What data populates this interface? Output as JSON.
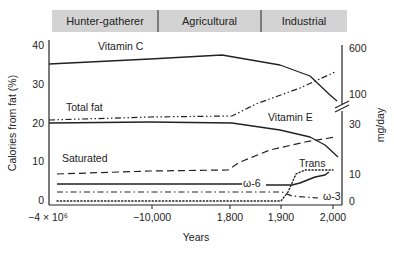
{
  "chart_data": {
    "type": "line",
    "title": "",
    "xlabel": "Years",
    "ylabel_left": "Calories from fat (%)",
    "ylabel_right": "mg/day",
    "grid": false,
    "eras": [
      {
        "label": "Hunter-gatherer",
        "x_start": 52,
        "x_end": 158
      },
      {
        "label": "Agricultural",
        "x_start": 158,
        "x_end": 261
      },
      {
        "label": "Industrial",
        "x_start": 261,
        "x_end": 347
      }
    ],
    "x_ticks": [
      {
        "label": "−4 × 10⁶",
        "px": 48
      },
      {
        "label": "−10,000",
        "px": 152
      },
      {
        "label": "1,800",
        "px": 230
      },
      {
        "label": "1,900",
        "px": 281
      },
      {
        "label": "2,000",
        "px": 333
      }
    ],
    "y_left_ticks": [
      {
        "label": "40",
        "value": 40
      },
      {
        "label": "30",
        "value": 30
      },
      {
        "label": "20",
        "value": 20
      },
      {
        "label": "10",
        "value": 10
      },
      {
        "label": "0",
        "value": 0
      }
    ],
    "y_left_range": [
      0,
      40
    ],
    "y_right_ticks": [
      {
        "label": "600",
        "py": 48
      },
      {
        "label": "100",
        "py": 94
      },
      {
        "label": "30",
        "py": 124
      },
      {
        "label": "10",
        "py": 174
      },
      {
        "label": "0",
        "py": 201
      }
    ],
    "series": [
      {
        "name": "Vitamin C",
        "axis": "right",
        "style": "solid",
        "width": 1.3,
        "label_pos": [
          98,
          50
        ],
        "points": [
          [
            49,
            64
          ],
          [
            150,
            59
          ],
          [
            222,
            55
          ],
          [
            280,
            65
          ],
          [
            310,
            76
          ],
          [
            330,
            95
          ],
          [
            337,
            101
          ]
        ]
      },
      {
        "name": "Total fat",
        "axis": "left",
        "style": "dashdotdot",
        "width": 1.2,
        "label_pos": [
          66,
          111
        ],
        "points": [
          [
            49,
            120
          ],
          [
            150,
            117
          ],
          [
            232,
            116
          ],
          [
            256,
            104
          ],
          [
            300,
            88
          ],
          [
            335,
            72
          ]
        ],
        "values_pct": [
          21,
          21.5,
          22,
          25,
          30,
          34
        ]
      },
      {
        "name": "Vitamin E",
        "axis": "right",
        "style": "solid",
        "width": 1.3,
        "label_pos": [
          268,
          121
        ],
        "points": [
          [
            49,
            123
          ],
          [
            150,
            122
          ],
          [
            232,
            123
          ],
          [
            280,
            130
          ],
          [
            310,
            137
          ],
          [
            325,
            145
          ],
          [
            338,
            157
          ]
        ]
      },
      {
        "name": "Saturated",
        "axis": "left",
        "style": "dashed",
        "width": 1.2,
        "label_pos": [
          62,
          162
        ],
        "points": [
          [
            57,
            174
          ],
          [
            150,
            171
          ],
          [
            228,
            170
          ],
          [
            240,
            162
          ],
          [
            270,
            150
          ],
          [
            305,
            142
          ],
          [
            335,
            137
          ]
        ],
        "values_pct": [
          7,
          7.5,
          8,
          10,
          13.5,
          15.5,
          17
        ]
      },
      {
        "name": "ω-6",
        "axis": "left",
        "style": "solid",
        "width": 1.5,
        "label_pos": [
          243,
          187
        ],
        "points": [
          [
            57,
            184
          ],
          [
            242,
            184
          ]
        ],
        "points2": [
          [
            266,
            185
          ],
          [
            292,
            185
          ],
          [
            300,
            183
          ],
          [
            315,
            177
          ],
          [
            325,
            175
          ],
          [
            329,
            172
          ]
        ],
        "values_pct": [
          4.5,
          4.5,
          4.5,
          5,
          6.5,
          7.5
        ]
      },
      {
        "name": "Trans",
        "axis": "left",
        "style": "dotted",
        "width": 1.4,
        "label_pos": [
          299,
          167
        ],
        "points": [
          [
            57,
            201
          ],
          [
            281,
            201
          ],
          [
            288,
            192
          ],
          [
            296,
            174
          ],
          [
            305,
            170
          ],
          [
            333,
            170
          ]
        ],
        "values_pct": [
          0.5,
          0.5,
          3,
          8,
          9,
          9
        ]
      },
      {
        "name": "ω-3",
        "axis": "left",
        "style": "dashdot",
        "width": 1.2,
        "label_pos": [
          323,
          200
        ],
        "points": [
          [
            57,
            192
          ],
          [
            282,
            192
          ],
          [
            292,
            196
          ],
          [
            305,
            197
          ],
          [
            318,
            198
          ]
        ],
        "values_pct": [
          2.5,
          2.5,
          1.5,
          1.2,
          1.0
        ]
      }
    ]
  },
  "axes": {
    "years_label": "Years",
    "calories_label": "Calories from fat (%)",
    "mgday_label": "mg/day"
  }
}
